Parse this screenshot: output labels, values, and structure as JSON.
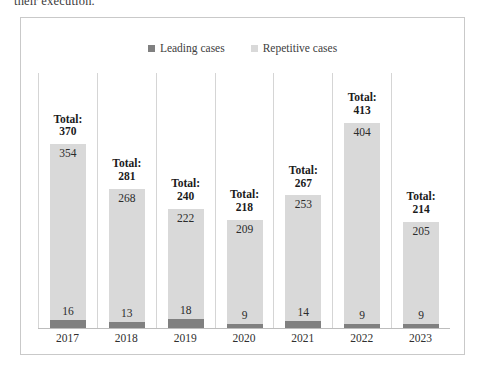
{
  "document": {
    "text_fragment": "their execution."
  },
  "figure": {
    "legend": [
      {
        "label": "Leading cases",
        "color": "#808080",
        "key": "leading"
      },
      {
        "label": "Repetitive cases",
        "color": "#d9d9d9",
        "key": "repetitive"
      }
    ],
    "total_prefix": "Total:"
  },
  "chart_data": {
    "type": "bar",
    "stacked": true,
    "title": "",
    "xlabel": "",
    "ylabel": "",
    "grid": false,
    "legend_position": "top-center",
    "axis_visible": {
      "x": true,
      "y": false
    },
    "ylim": [
      0,
      413
    ],
    "categories": [
      "2017",
      "2018",
      "2019",
      "2020",
      "2021",
      "2022",
      "2023"
    ],
    "series": [
      {
        "name": "Leading cases",
        "color": "#808080",
        "values": [
          16,
          13,
          18,
          9,
          14,
          9,
          9
        ]
      },
      {
        "name": "Repetitive cases",
        "color": "#d9d9d9",
        "values": [
          354,
          268,
          222,
          209,
          253,
          404,
          205
        ]
      }
    ],
    "totals": [
      370,
      281,
      240,
      218,
      267,
      413,
      214
    ],
    "annotations": [
      {
        "category": "2017",
        "text": "Total: 370"
      },
      {
        "category": "2018",
        "text": "Total: 281"
      },
      {
        "category": "2019",
        "text": "Total: 240"
      },
      {
        "category": "2020",
        "text": "Total: 218"
      },
      {
        "category": "2021",
        "text": "Total: 267"
      },
      {
        "category": "2022",
        "text": "Total: 413"
      },
      {
        "category": "2023",
        "text": "Total: 214"
      }
    ]
  }
}
